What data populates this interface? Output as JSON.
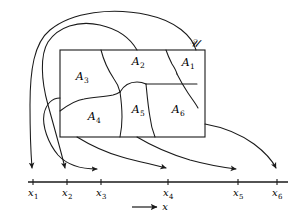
{
  "figure": {
    "type": "set-to-real-line-mapping-diagram",
    "background_color": "#ffffff",
    "stroke_color": "#1a1a1a"
  },
  "universe": {
    "label": "ℋ",
    "label_display": "𝒰",
    "description": "sample space rectangle"
  },
  "regions": [
    {
      "label": "A",
      "subscript": "1",
      "name": "region-a1"
    },
    {
      "label": "A",
      "subscript": "2",
      "name": "region-a2"
    },
    {
      "label": "A",
      "subscript": "3",
      "name": "region-a3"
    },
    {
      "label": "A",
      "subscript": "4",
      "name": "region-a4"
    },
    {
      "label": "A",
      "subscript": "5",
      "name": "region-a5"
    },
    {
      "label": "A",
      "subscript": "6",
      "name": "region-a6"
    }
  ],
  "axis": {
    "name": "x",
    "arrow_label": "x",
    "ticks": [
      {
        "label": "x",
        "subscript": "1"
      },
      {
        "label": "x",
        "subscript": "2"
      },
      {
        "label": "x",
        "subscript": "3"
      },
      {
        "label": "x",
        "subscript": "4"
      },
      {
        "label": "x",
        "subscript": "5"
      },
      {
        "label": "x",
        "subscript": "6"
      }
    ]
  },
  "mappings": [
    {
      "from": "A1",
      "to": "x1"
    },
    {
      "from": "A2",
      "to": "x2"
    },
    {
      "from": "A3",
      "to": "x3"
    },
    {
      "from": "A4",
      "to": "x4"
    },
    {
      "from": "A5",
      "to": "x5"
    },
    {
      "from": "A6",
      "to": "x6"
    }
  ]
}
